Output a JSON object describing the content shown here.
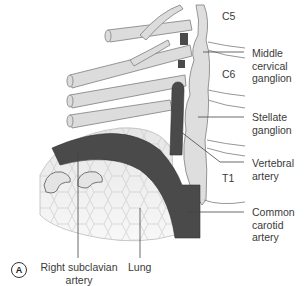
{
  "figure": {
    "panel_label": "A",
    "vertebral_levels": [
      "C5",
      "C6",
      "T1"
    ],
    "labels": {
      "middle_cervical_ganglion": [
        "Middle",
        "cervical",
        "ganglion"
      ],
      "stellate_ganglion": [
        "Stellate",
        "ganglion"
      ],
      "vertebral_artery": [
        "Vertebral",
        "artery"
      ],
      "common_carotid_artery": [
        "Common",
        "carotid",
        "artery"
      ],
      "right_subclavian_artery": [
        "Right subclavian",
        "artery"
      ],
      "lung": [
        "Lung"
      ]
    },
    "colors": {
      "artery": "#4a4a4a",
      "nerve": "#d9d9d9",
      "outline": "#8a8a8a",
      "lung": "#ececec",
      "ganglion": "#dedede",
      "leader": "#444444"
    }
  }
}
